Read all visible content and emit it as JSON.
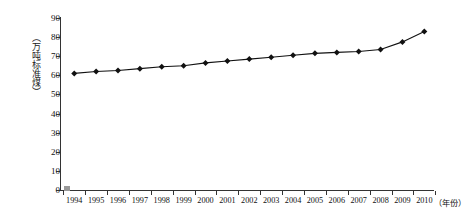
{
  "chart_data": {
    "type": "line",
    "title": "",
    "xlabel": "（年份）",
    "ylabel": "（万吨标准煤）",
    "categories": [
      "1994",
      "1995",
      "1996",
      "1997",
      "1998",
      "1999",
      "2000",
      "2001",
      "2002",
      "2003",
      "2004",
      "2005",
      "2006",
      "2007",
      "2008",
      "2009",
      "2010"
    ],
    "values": [
      61,
      62,
      62.5,
      63.5,
      64.5,
      65,
      66.5,
      67.5,
      68.5,
      69.5,
      70.5,
      71.5,
      72,
      72.5,
      73.5,
      77.5,
      83
    ],
    "ylim": [
      0,
      90
    ],
    "yticks": [
      0,
      10,
      20,
      30,
      40,
      50,
      60,
      70,
      80,
      90
    ],
    "grid": false,
    "legend": null,
    "marker": "diamond",
    "line_color": "#111111",
    "marker_color": "#111111"
  },
  "axes": {
    "y_label_text": "（万吨标准煤）",
    "x_label_text": "（年份）",
    "y_tick_labels": [
      "90",
      "80",
      "70",
      "60",
      "50",
      "40",
      "30",
      "20",
      "10",
      "0"
    ],
    "x_tick_labels": [
      "1994",
      "1995",
      "1996",
      "1997",
      "1998",
      "1999",
      "2000",
      "2001",
      "2002",
      "2003",
      "2004",
      "2005",
      "2006",
      "2007",
      "2008",
      "2009",
      "2010"
    ]
  },
  "legend_marker": {
    "color": "#9a9a9a",
    "shape": "square"
  }
}
